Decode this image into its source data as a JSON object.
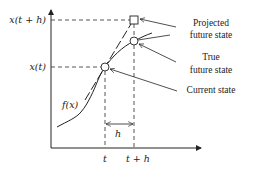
{
  "diagram": {
    "axes": {
      "y_ticks": [
        {
          "label": "x(t + h)",
          "y": 20
        },
        {
          "label": "x(t)",
          "y": 67
        }
      ],
      "x_ticks": [
        {
          "label": "t",
          "x": 105
        },
        {
          "label": "t + h",
          "x": 134
        }
      ]
    },
    "curve_label": "f(x)",
    "interval_label": "h",
    "annotations": [
      {
        "id": "projected",
        "line1": "Projected",
        "line2": "future state",
        "marker": "square"
      },
      {
        "id": "true",
        "line1": "True",
        "line2": "future state",
        "marker": "circle"
      },
      {
        "id": "current",
        "line1": "Current state",
        "marker": "circle"
      }
    ],
    "colors": {
      "stroke": "#222222",
      "dashed": "#444444",
      "background": "#ffffff"
    }
  }
}
